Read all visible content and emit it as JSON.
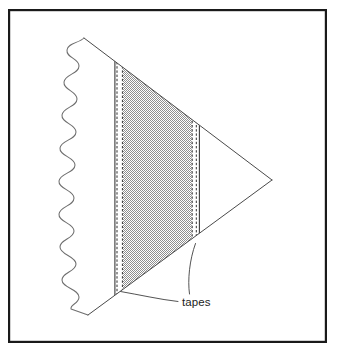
{
  "figure": {
    "background_color": "#ffffff",
    "frame": {
      "name": "figure-border",
      "stroke_color": "#1a1a1a",
      "stroke_width": 2.2,
      "x": 8,
      "y": 9,
      "width": 319,
      "height": 334
    },
    "shape": {
      "name": "triangular-ply-stack",
      "stroke_color": "#4a4a4a",
      "stroke_width": 1.0,
      "fill": "none",
      "vertices": {
        "top": [
          84,
          38
        ],
        "right": [
          272,
          180
        ],
        "bottom": [
          88,
          315
        ]
      }
    },
    "torn_edge": {
      "name": "wavy-torn-edge",
      "stroke_color": "#6e6e6e",
      "stroke_width": 1.0,
      "description": "sinusoidal break line along left side",
      "wave_count": 9,
      "amplitude": 9,
      "start": [
        84,
        38
      ],
      "end": [
        88,
        315
      ]
    },
    "shaded_region": {
      "name": "shaded-ply-region",
      "fill_description": "50% checkerboard dither gray",
      "fill_color": "#9d9d9d",
      "left_x": 123,
      "right_x": 192
    },
    "tapes": [
      {
        "name": "left-tape",
        "x_left": 114,
        "x_right": 123,
        "fill_color": "#ffffff",
        "edge_style": "dashed",
        "edge_color": "#333333",
        "dash_pattern": "2.4 1.8"
      },
      {
        "name": "right-tape",
        "x_left": 192,
        "x_right": 200,
        "fill_color": "#ffffff",
        "edge_style": "dashed",
        "edge_color": "#333333",
        "dash_pattern": "2.4 1.8"
      }
    ],
    "annotation": {
      "name": "tapes-callout",
      "label": "tapes",
      "text_x": 182,
      "text_y": 306,
      "text_color": "#1c1c1c",
      "font_size_px": 11.5,
      "leader_color": "#4a4a4a",
      "leader_width": 0.9,
      "leaders": [
        {
          "name": "leader-to-left-tape",
          "from": [
            178,
            302
          ],
          "to": [
            120,
            291
          ]
        },
        {
          "name": "leader-to-right-tape",
          "from": [
            190,
            294
          ],
          "to": [
            196,
            243
          ]
        }
      ]
    }
  }
}
